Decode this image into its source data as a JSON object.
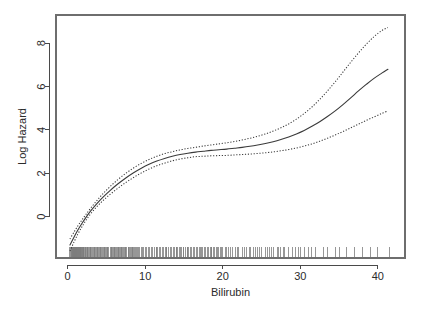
{
  "chart_data": {
    "type": "line",
    "title": "",
    "xlabel": "Bilirubin",
    "ylabel": "Log Hazard",
    "xlim": [
      -1.5,
      43.5
    ],
    "ylim": [
      -1.9,
      9.3
    ],
    "xticks": [
      0,
      10,
      20,
      30,
      40
    ],
    "xticklabels": [
      "0",
      "10",
      "20",
      "30",
      "40"
    ],
    "yticks": [
      0,
      2,
      4,
      6,
      8
    ],
    "yticklabels": [
      "0",
      "2",
      "4",
      "6",
      "8"
    ],
    "grid": false,
    "legend": "none",
    "series": [
      {
        "name": "fit",
        "style": "solid",
        "color": "#3a3a3a",
        "x": [
          0.3,
          0.8,
          1.3,
          1.8,
          2.3,
          3.0,
          3.8,
          4.6,
          5.5,
          6.5,
          7.5,
          8.5,
          9.5,
          10.5,
          11.5,
          12.5,
          13.5,
          14.5,
          15.5,
          16.5,
          17.5,
          18.5,
          19.5,
          20.5,
          21.5,
          22.5,
          23.5,
          24.5,
          25.5,
          26.5,
          27.5,
          28.5,
          29.5,
          30.5,
          31.5,
          32.5,
          33.5,
          34.5,
          35.5,
          36.5,
          37.5,
          38.5,
          39.5,
          40.5,
          41.3
        ],
        "y": [
          -1.3,
          -0.95,
          -0.62,
          -0.33,
          -0.06,
          0.28,
          0.62,
          0.92,
          1.22,
          1.52,
          1.79,
          2.03,
          2.24,
          2.42,
          2.57,
          2.69,
          2.79,
          2.87,
          2.93,
          2.98,
          3.02,
          3.06,
          3.09,
          3.12,
          3.16,
          3.2,
          3.25,
          3.31,
          3.38,
          3.46,
          3.56,
          3.68,
          3.82,
          3.98,
          4.17,
          4.38,
          4.62,
          4.88,
          5.17,
          5.48,
          5.8,
          6.1,
          6.38,
          6.62,
          6.8
        ]
      },
      {
        "name": "upper_confidence_band",
        "style": "dotted",
        "color": "#3a3a3a",
        "x": [
          0.3,
          0.8,
          1.3,
          1.8,
          2.3,
          3.0,
          3.8,
          4.6,
          5.5,
          6.5,
          7.5,
          8.5,
          9.5,
          10.5,
          11.5,
          12.5,
          13.5,
          14.5,
          15.5,
          16.5,
          17.5,
          18.5,
          19.5,
          20.5,
          21.5,
          22.5,
          23.5,
          24.5,
          25.5,
          26.5,
          27.5,
          28.5,
          29.5,
          30.5,
          31.5,
          32.5,
          33.5,
          34.5,
          35.5,
          36.5,
          37.5,
          38.5,
          39.5,
          40.5,
          41.3
        ],
        "y": [
          -1.02,
          -0.72,
          -0.43,
          -0.17,
          0.08,
          0.41,
          0.76,
          1.08,
          1.4,
          1.72,
          2.0,
          2.25,
          2.46,
          2.64,
          2.79,
          2.91,
          3.0,
          3.08,
          3.15,
          3.2,
          3.26,
          3.31,
          3.36,
          3.41,
          3.47,
          3.54,
          3.62,
          3.71,
          3.82,
          3.95,
          4.1,
          4.28,
          4.5,
          4.76,
          5.06,
          5.41,
          5.8,
          6.22,
          6.67,
          7.12,
          7.55,
          7.95,
          8.3,
          8.58,
          8.72
        ]
      },
      {
        "name": "lower_confidence_band",
        "style": "dotted",
        "color": "#3a3a3a",
        "x": [
          0.3,
          0.8,
          1.3,
          1.8,
          2.3,
          3.0,
          3.8,
          4.6,
          5.5,
          6.5,
          7.5,
          8.5,
          9.5,
          10.5,
          11.5,
          12.5,
          13.5,
          14.5,
          15.5,
          16.5,
          17.5,
          18.5,
          19.5,
          20.5,
          21.5,
          22.5,
          23.5,
          24.5,
          25.5,
          26.5,
          27.5,
          28.5,
          29.5,
          30.5,
          31.5,
          32.5,
          33.5,
          34.5,
          35.5,
          36.5,
          37.5,
          38.5,
          39.5,
          40.5,
          41.3
        ],
        "y": [
          -1.58,
          -1.18,
          -0.81,
          -0.49,
          -0.2,
          0.15,
          0.48,
          0.76,
          1.04,
          1.32,
          1.58,
          1.81,
          2.02,
          2.2,
          2.35,
          2.47,
          2.58,
          2.66,
          2.72,
          2.77,
          2.79,
          2.81,
          2.82,
          2.83,
          2.85,
          2.87,
          2.89,
          2.92,
          2.95,
          2.99,
          3.04,
          3.1,
          3.17,
          3.26,
          3.36,
          3.48,
          3.62,
          3.77,
          3.93,
          4.1,
          4.27,
          4.44,
          4.6,
          4.76,
          4.88
        ]
      }
    ],
    "rug": {
      "name": "data-rug",
      "y_value": -1.62,
      "values": [
        0.3,
        0.4,
        0.5,
        0.5,
        0.6,
        0.6,
        0.6,
        0.7,
        0.7,
        0.7,
        0.7,
        0.8,
        0.8,
        0.8,
        0.8,
        0.8,
        0.9,
        0.9,
        0.9,
        0.9,
        1.0,
        1.0,
        1.0,
        1.0,
        1.1,
        1.1,
        1.1,
        1.2,
        1.2,
        1.2,
        1.3,
        1.3,
        1.3,
        1.4,
        1.4,
        1.4,
        1.5,
        1.5,
        1.5,
        1.6,
        1.6,
        1.7,
        1.7,
        1.8,
        1.8,
        1.9,
        1.9,
        2.0,
        2.0,
        2.1,
        2.1,
        2.2,
        2.3,
        2.3,
        2.4,
        2.5,
        2.5,
        2.6,
        2.7,
        2.8,
        2.9,
        3.0,
        3.0,
        3.1,
        3.2,
        3.3,
        3.4,
        3.5,
        3.6,
        3.7,
        3.8,
        3.9,
        4.0,
        4.1,
        4.2,
        4.3,
        4.4,
        4.5,
        4.6,
        4.7,
        4.8,
        4.9,
        5.0,
        5.1,
        5.2,
        5.3,
        5.5,
        5.6,
        5.7,
        5.8,
        5.9,
        6.0,
        6.1,
        6.2,
        6.3,
        6.4,
        6.5,
        6.6,
        6.7,
        6.8,
        6.9,
        7.0,
        7.1,
        7.2,
        7.3,
        7.4,
        7.5,
        7.6,
        7.8,
        7.9,
        8.0,
        8.1,
        8.2,
        8.3,
        8.4,
        8.5,
        8.6,
        8.8,
        8.9,
        9.0,
        9.2,
        9.3,
        9.5,
        9.6,
        9.8,
        10.0,
        10.2,
        10.4,
        10.6,
        10.8,
        11.0,
        11.2,
        11.4,
        11.5,
        11.6,
        11.8,
        12.0,
        12.2,
        12.4,
        12.6,
        12.7,
        12.8,
        13.0,
        13.2,
        13.4,
        13.6,
        13.8,
        14.0,
        14.1,
        14.2,
        14.4,
        14.5,
        14.7,
        14.9,
        15.0,
        15.2,
        15.4,
        15.5,
        15.6,
        15.8,
        16.0,
        16.2,
        16.4,
        16.6,
        16.8,
        17.0,
        17.1,
        17.2,
        17.4,
        17.6,
        17.8,
        18.0,
        18.2,
        18.4,
        18.5,
        18.6,
        18.8,
        19.0,
        19.2,
        19.3,
        19.5,
        19.7,
        19.8,
        20.0,
        20.3,
        20.5,
        20.7,
        21.0,
        21.2,
        21.6,
        21.9,
        22.0,
        22.5,
        22.8,
        23.0,
        23.4,
        23.6,
        24.0,
        24.2,
        24.5,
        24.8,
        25.0,
        25.5,
        25.8,
        26.0,
        26.3,
        26.6,
        27.0,
        27.2,
        27.5,
        27.8,
        28.0,
        28.5,
        29.0,
        29.4,
        29.8,
        30.0,
        30.5,
        31.0,
        31.5,
        32.0,
        33.0,
        33.5,
        34.5,
        35.0,
        36.0,
        37.0,
        38.0,
        39.0,
        40.0,
        41.5
      ]
    }
  },
  "axis": {
    "x_title": "Bilirubin",
    "y_title": "Log Hazard"
  }
}
